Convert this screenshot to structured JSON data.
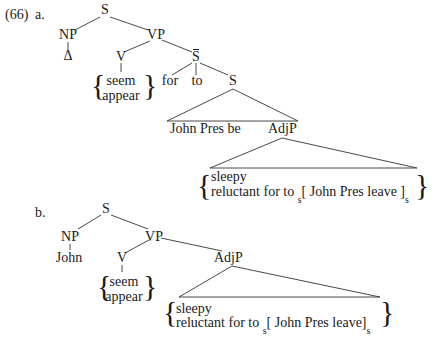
{
  "example": {
    "number": "(66)",
    "a": {
      "label": "a.",
      "nodes": {
        "S": "S",
        "NP": "NP",
        "delta": "Δ",
        "VP": "VP",
        "V": "V",
        "verb_options": [
          "seem",
          "appear"
        ],
        "Sbar": "S",
        "for": "for",
        "to": "to",
        "S_inner": "S",
        "triangle_text": "John Pres be",
        "AdjP": "AdjP",
        "adj_options_line1": "sleepy",
        "adj_options_line2_prefix": "reluctant for to",
        "embedded_sub_open": "s",
        "embedded_clause": "[ John Pres leave ]",
        "embedded_sub_close": "s"
      }
    },
    "b": {
      "label": "b.",
      "nodes": {
        "S": "S",
        "NP": "NP",
        "John": "John",
        "VP": "VP",
        "V": "V",
        "verb_options": [
          "seem",
          "appear"
        ],
        "AdjP": "AdjP",
        "adj_options_line1": "sleepy",
        "adj_options_line2_prefix": "reluctant for to",
        "embedded_sub_open": "s",
        "embedded_clause": "[ John Pres leave]",
        "embedded_sub_close": "s"
      }
    }
  }
}
